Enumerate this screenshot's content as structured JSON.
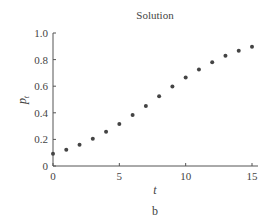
{
  "chart_data": {
    "type": "scatter",
    "title": "Solution",
    "xlabel": "t",
    "ylabel": "p_t",
    "ylabel_main": "p",
    "ylabel_sub": "t",
    "caption": "b",
    "xlim": [
      0,
      15
    ],
    "ylim": [
      0,
      1.0
    ],
    "xticks": [
      0,
      5,
      10,
      15
    ],
    "xtick_labels": [
      "0",
      "5",
      "10",
      "15"
    ],
    "yticks": [
      0,
      0.2,
      0.4,
      0.6,
      0.8,
      1.0
    ],
    "ytick_labels": [
      "0",
      "0.2",
      "0.4",
      "0.6",
      "0.8",
      "1.0"
    ],
    "grid": false,
    "legend": null,
    "marker_color": "#444444",
    "series": [
      {
        "name": "p_t",
        "x": [
          0,
          1,
          2,
          3,
          4,
          5,
          6,
          7,
          8,
          9,
          10,
          11,
          12,
          13,
          14,
          15
        ],
        "y": [
          0.093,
          0.123,
          0.159,
          0.204,
          0.257,
          0.315,
          0.383,
          0.451,
          0.524,
          0.597,
          0.665,
          0.725,
          0.781,
          0.829,
          0.866,
          0.897
        ]
      }
    ]
  }
}
